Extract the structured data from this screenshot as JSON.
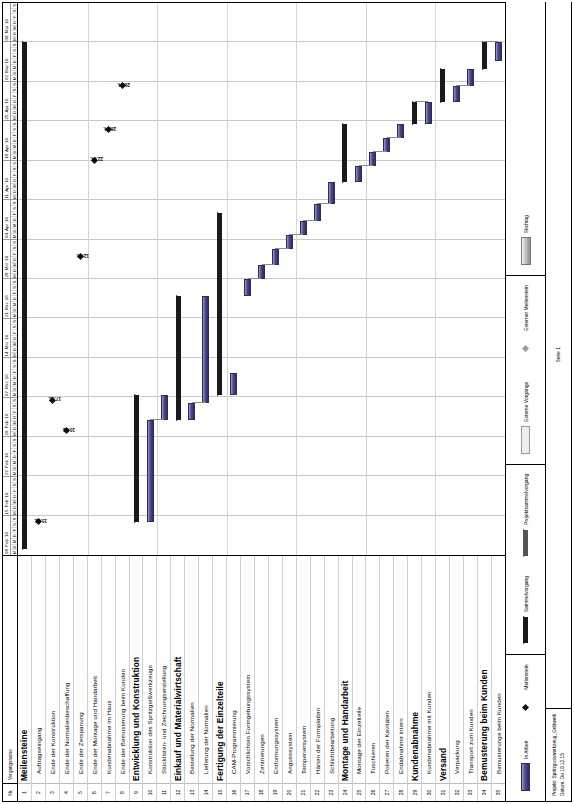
{
  "document": {
    "orientation": "landscape-rotated-90ccw",
    "page_label": "Seite 1",
    "project_line": "Projekt: Spritzgusswerkzeug_Grittwerk",
    "date_line": "Datum: Do 10.12.15"
  },
  "table": {
    "header": {
      "nr": "Nr.",
      "name": "Vorgangsname"
    },
    "rows": [
      {
        "nr": "1",
        "name": "Meilensteine",
        "level": 0
      },
      {
        "nr": "2",
        "name": "Auftragseingang",
        "level": 1
      },
      {
        "nr": "3",
        "name": "Ende der Konstruktion",
        "level": 1
      },
      {
        "nr": "4",
        "name": "Ende der Normalienbeschaffung",
        "level": 1
      },
      {
        "nr": "5",
        "name": "Ende der Zerspanung",
        "level": 1
      },
      {
        "nr": "6",
        "name": "Ende der Montage und Handarbeit",
        "level": 1
      },
      {
        "nr": "7",
        "name": "Kundenabnahme im Haus",
        "level": 1
      },
      {
        "nr": "8",
        "name": "Ende der Bemusterung beim Kunden",
        "level": 1
      },
      {
        "nr": "9",
        "name": "Entwicklung und Konstruktion",
        "level": 0
      },
      {
        "nr": "10",
        "name": "Konstruktion des Spritzgießwerkzeugs",
        "level": 1
      },
      {
        "nr": "11",
        "name": "Stücklisten- und Zeichnungserstellung",
        "level": 1
      },
      {
        "nr": "12",
        "name": "Einkauf und Materialwirtschaft",
        "level": 0
      },
      {
        "nr": "13",
        "name": "Bestellung der Normalien",
        "level": 1
      },
      {
        "nr": "14",
        "name": "Lieferung der Normalien",
        "level": 1
      },
      {
        "nr": "15",
        "name": "Fertigung der Einzelteile",
        "level": 0
      },
      {
        "nr": "16",
        "name": "CAM-Programmierung",
        "level": 1
      },
      {
        "nr": "17",
        "name": "Vorschlichten Formgebungssystem",
        "level": 1
      },
      {
        "nr": "18",
        "name": "Zentrierungen",
        "level": 1
      },
      {
        "nr": "19",
        "name": "Entformungssystem",
        "level": 1
      },
      {
        "nr": "20",
        "name": "Angusssystem",
        "level": 1
      },
      {
        "nr": "21",
        "name": "Temperiersystem",
        "level": 1
      },
      {
        "nr": "22",
        "name": "Härten der Formplatten",
        "level": 1
      },
      {
        "nr": "23",
        "name": "Schlichtbearbeitung",
        "level": 1
      },
      {
        "nr": "24",
        "name": "Montage und Handarbeit",
        "level": 0
      },
      {
        "nr": "25",
        "name": "Montage der Einzelteile",
        "level": 1
      },
      {
        "nr": "26",
        "name": "Tuschieren",
        "level": 1
      },
      {
        "nr": "27",
        "name": "Polieren der Kavitäten",
        "level": 1
      },
      {
        "nr": "28",
        "name": "Endabnahme intern",
        "level": 1
      },
      {
        "nr": "29",
        "name": "Kundenabnahme",
        "level": 0
      },
      {
        "nr": "30",
        "name": "Kundenabnahme mit Kunden",
        "level": 1
      },
      {
        "nr": "31",
        "name": "Versand",
        "level": 0
      },
      {
        "nr": "32",
        "name": "Verpackung",
        "level": 1
      },
      {
        "nr": "33",
        "name": "Transport zum Kunden",
        "level": 1
      },
      {
        "nr": "34",
        "name": "Bemusterung beim Kunden",
        "level": 0
      },
      {
        "nr": "35",
        "name": "Bemusterunge beim Kunden",
        "level": 1
      }
    ]
  },
  "timescale": {
    "day_letters": [
      "M",
      "D",
      "M",
      "D",
      "F",
      "S",
      "S"
    ],
    "weeks": [
      "08. Feb '16",
      "15. Feb '16",
      "22. Feb '16",
      "29. Feb '16",
      "07. Mrz '16",
      "14. Mrz '16",
      "21. Mrz '16",
      "28. Mrz '16",
      "04. Apr '16",
      "11. Apr '16",
      "18. Apr '16",
      "25. Apr '16",
      "02. Mai '16",
      "09. Mai '16"
    ]
  },
  "legend": {
    "items": [
      {
        "label": "In Arbeit",
        "symbol": "bar"
      },
      {
        "label": "Meilenstein",
        "symbol": "milestone"
      },
      {
        "label": "Sammelvorgang",
        "symbol": "summary"
      },
      {
        "label": "Projektsammelvorgang",
        "symbol": "project-summary"
      },
      {
        "label": "Externe Vorgänge",
        "symbol": "external-task"
      },
      {
        "label": "Externer Meilenstein",
        "symbol": "external-milestone"
      },
      {
        "label": "Stichtag",
        "symbol": "deadline"
      }
    ]
  },
  "chart_data": {
    "type": "bar",
    "subtype": "gantt",
    "xlabel": "",
    "ylabel": "",
    "grid": true,
    "legend_position": "bottom",
    "x_axis": {
      "kind": "time",
      "start": "2016-02-08",
      "end": "2016-05-15",
      "tick_unit": "week",
      "tick_labels": [
        "08. Feb '16",
        "15. Feb '16",
        "22. Feb '16",
        "29. Feb '16",
        "07. Mrz '16",
        "14. Mrz '16",
        "21. Mrz '16",
        "28. Mrz '16",
        "04. Apr '16",
        "11. Apr '16",
        "18. Apr '16",
        "25. Apr '16",
        "02. Mai '16",
        "09. Mai '16"
      ],
      "minor_tick_labels": [
        "M",
        "D",
        "M",
        "D",
        "F",
        "S",
        "S"
      ]
    },
    "categories": [
      "Meilensteine",
      "Auftragseingang",
      "Ende der Konstruktion",
      "Ende der Normalienbeschaffung",
      "Ende der Zerspanung",
      "Ende der Montage und Handarbeit",
      "Kundenabnahme im Haus",
      "Ende der Bemusterung beim Kunden",
      "Entwicklung und Konstruktion",
      "Konstruktion des Spritzgießwerkzeugs",
      "Stücklisten- und Zeichnungserstellung",
      "Einkauf und Materialwirtschaft",
      "Bestellung der Normalien",
      "Lieferung der Normalien",
      "Fertigung der Einzelteile",
      "CAM-Programmierung",
      "Vorschlichten Formgebungssystem",
      "Zentrierungen",
      "Entformungssystem",
      "Angusssystem",
      "Temperiersystem",
      "Härten der Formplatten",
      "Schlichtbearbeitung",
      "Montage und Handarbeit",
      "Montage der Einzelteile",
      "Tuschieren",
      "Polieren der Kavitäten",
      "Endabnahme intern",
      "Kundenabnahme",
      "Kundenabnahme mit Kunden",
      "Versand",
      "Verpackung",
      "Transport zum Kunden",
      "Bemusterung beim Kunden",
      "Bemusterunge beim Kunden"
    ],
    "tasks": [
      {
        "nr": 1,
        "name": "Meilensteine",
        "kind": "summary",
        "start_pct": 1.0,
        "end_pct": 93.0
      },
      {
        "nr": 2,
        "name": "Auftragseingang",
        "kind": "milestone",
        "at_pct": 6.0,
        "label": "15.02."
      },
      {
        "nr": 3,
        "name": "Ende der Konstruktion",
        "kind": "milestone",
        "at_pct": 28.0,
        "label": "17.03."
      },
      {
        "nr": 4,
        "name": "Ende der Normalienbeschaffung",
        "kind": "milestone",
        "at_pct": 22.5,
        "label": "10.03."
      },
      {
        "nr": 5,
        "name": "Ende der Zerspanung",
        "kind": "milestone",
        "at_pct": 54.0,
        "label": "12.04."
      },
      {
        "nr": 6,
        "name": "Ende der Montage und Handarbeit",
        "kind": "milestone",
        "at_pct": 71.5,
        "label": "22.04."
      },
      {
        "nr": 7,
        "name": "Kundenabnahme im Haus",
        "kind": "milestone",
        "at_pct": 77.0,
        "label": "26.04."
      },
      {
        "nr": 8,
        "name": "Ende der Bemusterung beim Kunden",
        "kind": "milestone",
        "at_pct": 85.0,
        "label": "29.04."
      },
      {
        "nr": 9,
        "name": "Entwicklung und Konstruktion",
        "kind": "summary",
        "start_pct": 6.0,
        "end_pct": 29.0
      },
      {
        "nr": 10,
        "name": "Konstruktion des Spritzgießwerkzeugs",
        "kind": "task",
        "start_pct": 6.0,
        "end_pct": 24.5
      },
      {
        "nr": 11,
        "name": "Stücklisten- und Zeichnungserstellung",
        "kind": "task",
        "start_pct": 24.5,
        "end_pct": 29.0
      },
      {
        "nr": 12,
        "name": "Einkauf und Materialwirtschaft",
        "kind": "summary",
        "start_pct": 24.5,
        "end_pct": 47.0
      },
      {
        "nr": 13,
        "name": "Bestellung der Normalien",
        "kind": "task",
        "start_pct": 24.5,
        "end_pct": 27.5
      },
      {
        "nr": 14,
        "name": "Lieferung der Normalien",
        "kind": "task",
        "start_pct": 27.5,
        "end_pct": 47.0
      },
      {
        "nr": 15,
        "name": "Fertigung der Einzelteile",
        "kind": "summary",
        "start_pct": 29.0,
        "end_pct": 62.0
      },
      {
        "nr": 16,
        "name": "CAM-Programmierung",
        "kind": "task",
        "start_pct": 29.0,
        "end_pct": 33.0
      },
      {
        "nr": 17,
        "name": "Vorschlichten Formgebungssystem",
        "kind": "task",
        "start_pct": 47.0,
        "end_pct": 50.0
      },
      {
        "nr": 18,
        "name": "Zentrierungen",
        "kind": "task",
        "start_pct": 50.0,
        "end_pct": 52.5
      },
      {
        "nr": 19,
        "name": "Entformungssystem",
        "kind": "task",
        "start_pct": 52.5,
        "end_pct": 55.5
      },
      {
        "nr": 20,
        "name": "Angusssystem",
        "kind": "task",
        "start_pct": 55.5,
        "end_pct": 58.0
      },
      {
        "nr": 21,
        "name": "Temperiersystem",
        "kind": "task",
        "start_pct": 58.0,
        "end_pct": 60.5
      },
      {
        "nr": 22,
        "name": "Härten der Formplatten",
        "kind": "task",
        "start_pct": 60.5,
        "end_pct": 63.5
      },
      {
        "nr": 23,
        "name": "Schlichtbearbeitung",
        "kind": "task",
        "start_pct": 63.5,
        "end_pct": 67.5
      },
      {
        "nr": 24,
        "name": "Montage und Handarbeit",
        "kind": "summary",
        "start_pct": 67.5,
        "end_pct": 78.0
      },
      {
        "nr": 25,
        "name": "Montage der Einzelteile",
        "kind": "task",
        "start_pct": 67.5,
        "end_pct": 70.5
      },
      {
        "nr": 26,
        "name": "Tuschieren",
        "kind": "task",
        "start_pct": 70.5,
        "end_pct": 73.0
      },
      {
        "nr": 27,
        "name": "Polieren der Kavitäten",
        "kind": "task",
        "start_pct": 73.0,
        "end_pct": 75.5
      },
      {
        "nr": 28,
        "name": "Endabnahme intern",
        "kind": "task",
        "start_pct": 75.5,
        "end_pct": 78.0
      },
      {
        "nr": 29,
        "name": "Kundenabnahme",
        "kind": "summary",
        "start_pct": 78.0,
        "end_pct": 82.0
      },
      {
        "nr": 30,
        "name": "Kundenabnahme mit Kunden",
        "kind": "task",
        "start_pct": 78.0,
        "end_pct": 82.0
      },
      {
        "nr": 31,
        "name": "Versand",
        "kind": "summary",
        "start_pct": 82.0,
        "end_pct": 88.0
      },
      {
        "nr": 32,
        "name": "Verpackung",
        "kind": "task",
        "start_pct": 82.0,
        "end_pct": 85.0
      },
      {
        "nr": 33,
        "name": "Transport zum Kunden",
        "kind": "task",
        "start_pct": 85.0,
        "end_pct": 88.0
      },
      {
        "nr": 34,
        "name": "Bemusterung beim Kunden",
        "kind": "summary",
        "start_pct": 88.0,
        "end_pct": 93.0
      },
      {
        "nr": 35,
        "name": "Bemusterunge beim Kunden",
        "kind": "task",
        "start_pct": 89.5,
        "end_pct": 93.0
      }
    ],
    "milestone_labels": [
      "15.02.",
      "10.03.",
      "17.03.",
      "12.04.",
      "22.04.",
      "26.04.",
      "29.04."
    ]
  }
}
